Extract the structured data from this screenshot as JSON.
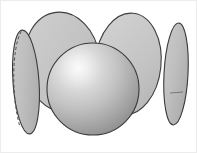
{
  "figure": {
    "background_color": "#ffffff",
    "frame_color": "#e8e8e8",
    "width": 197,
    "height": 153,
    "outline_color": "#3b3b3b",
    "disk_fill_light": "#c6c6c6",
    "disk_fill_mid": "#bdbdbd",
    "disk_fill_edge": "#a8a8a8",
    "sphere_highlight_color": "#f2f2f2",
    "sphere_mid_color": "#bcbcbc",
    "sphere_shadow_color": "#8d8d8d",
    "hidden_line_color": "#4a4a4a",
    "shapes": [
      {
        "name": "left-edge-disk",
        "kind": "ellipse",
        "cx": 26,
        "cy": 82,
        "rx": 13,
        "ry": 52,
        "rotation": -4,
        "has_hidden_arc": true
      },
      {
        "name": "back-left-disk",
        "kind": "ellipse",
        "cx": 62,
        "cy": 62,
        "rx": 38,
        "ry": 50,
        "rotation": -7,
        "has_hidden_arc": false
      },
      {
        "name": "back-right-disk",
        "kind": "ellipse",
        "cx": 128,
        "cy": 64,
        "rx": 33,
        "ry": 51,
        "rotation": 6,
        "has_hidden_arc": false
      },
      {
        "name": "right-edge-disk",
        "kind": "ellipse",
        "cx": 176,
        "cy": 74,
        "rx": 12,
        "ry": 51,
        "rotation": 3,
        "has_hidden_arc": false,
        "has_tick_mark": true
      },
      {
        "name": "center-sphere",
        "kind": "sphere",
        "cx": 93,
        "cy": 89,
        "r": 46,
        "highlight_x": 78,
        "highlight_y": 62
      }
    ]
  }
}
